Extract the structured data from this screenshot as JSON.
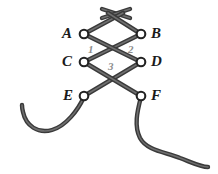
{
  "figure": {
    "background_color": "#ffffff",
    "lace_color": "#3a3a3a",
    "lace_highlight_color": "#6e6e6e",
    "eyelet_ring_color": "#2b2b2b",
    "eyelet_fill_color": "#ffffff",
    "vertex_label_color": "#1a1a1a",
    "segment_label_color": "#8d8d8d"
  },
  "eyelets": [
    {
      "id": "A",
      "label": "A",
      "x": 84,
      "y": 34,
      "label_side": "left"
    },
    {
      "id": "B",
      "label": "B",
      "x": 141,
      "y": 34,
      "label_side": "right"
    },
    {
      "id": "C",
      "label": "C",
      "x": 84,
      "y": 62,
      "label_side": "left"
    },
    {
      "id": "D",
      "label": "D",
      "x": 141,
      "y": 62,
      "label_side": "right"
    },
    {
      "id": "E",
      "label": "E",
      "x": 84,
      "y": 96,
      "label_side": "left"
    },
    {
      "id": "F",
      "label": "F",
      "x": 141,
      "y": 96,
      "label_side": "right"
    }
  ],
  "segment_labels": [
    {
      "id": "1",
      "label": "1",
      "x": 92,
      "y": 50
    },
    {
      "id": "2",
      "label": "2",
      "x": 131,
      "y": 50
    },
    {
      "id": "3",
      "label": "3",
      "x": 112,
      "y": 67
    }
  ],
  "lace_segments": [
    {
      "id": "top-cross-left",
      "from": "above-A",
      "to": "above-B"
    },
    {
      "id": "top-cross-right",
      "from": "above-B",
      "to": "above-A"
    },
    {
      "id": "A-to-B-upper",
      "from": "A",
      "to": "top-cross"
    },
    {
      "id": "B-to-A-upper",
      "from": "B",
      "to": "top-cross"
    },
    {
      "id": "A-to-D",
      "from": "A",
      "to": "D"
    },
    {
      "id": "B-to-C",
      "from": "B",
      "to": "C"
    },
    {
      "id": "C-to-F",
      "from": "C",
      "to": "F"
    },
    {
      "id": "D-to-E",
      "from": "D",
      "to": "E"
    },
    {
      "id": "E-tail",
      "from": "E",
      "to": "free-end-left"
    },
    {
      "id": "F-tail",
      "from": "F",
      "to": "free-end-right"
    }
  ]
}
